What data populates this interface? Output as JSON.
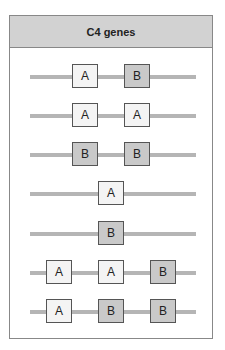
{
  "title": "C4 genes",
  "colors": {
    "A": "#f4f4f4",
    "B": "#c9c9c9",
    "line": "#b5b5b5",
    "header": "#d2d2d2"
  },
  "rows": [
    {
      "genes": [
        "A",
        "B"
      ]
    },
    {
      "genes": [
        "A",
        "A"
      ]
    },
    {
      "genes": [
        "B",
        "B"
      ]
    },
    {
      "genes": [
        "A"
      ]
    },
    {
      "genes": [
        "B"
      ]
    },
    {
      "genes": [
        "A",
        "A",
        "B"
      ]
    },
    {
      "genes": [
        "A",
        "B",
        "B"
      ]
    }
  ]
}
